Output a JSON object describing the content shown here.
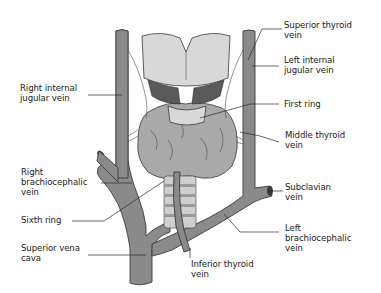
{
  "figure": {
    "labels": {
      "right_internal_jugular_vein": "Right internal\njugular vein",
      "right_brachiocephalic_vein": "Right\nbrachiocephalic\nvein",
      "sixth_ring": "Sixth ring",
      "superior_vena_cava": "Superior vena\ncava",
      "superior_thyroid_vein": "Superior thyroid\nvein",
      "left_internal_jugular_vein": "Left internal\njugular vein",
      "first_ring": "First ring",
      "middle_thyroid_vein": "Middle thyroid\nvein",
      "subclavian_vein": "Subclavian\nvein",
      "left_brachiocephalic_vein": "Left\nbrachiocephalic\nvein",
      "inferior_thyroid_vein": "Inferior thyroid\nvein"
    },
    "colors": {
      "vein": "#8a8a8a",
      "outline": "#3a3a3a",
      "thyroid": "#a9a9a9",
      "cartilage": "#d8d8d8",
      "text": "#1a1a1a"
    }
  }
}
